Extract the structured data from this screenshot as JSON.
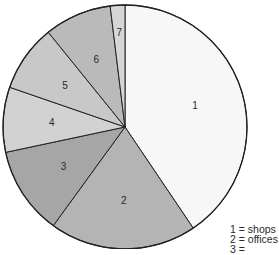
{
  "chart_data": {
    "type": "pie",
    "title": "",
    "start_angle_deg": 0,
    "direction": "clockwise",
    "center": [
      125,
      127
    ],
    "radius": 122,
    "slices": [
      {
        "label": "1",
        "category": "shops",
        "angle_deg": 146,
        "share_pct": 40.6,
        "color": "#f7f7f7"
      },
      {
        "label": "2",
        "category": "offices",
        "angle_deg": 70,
        "share_pct": 19.4,
        "color": "#b4b4b4"
      },
      {
        "label": "3",
        "category": "",
        "angle_deg": 42,
        "share_pct": 11.7,
        "color": "#a6a6a6"
      },
      {
        "label": "4",
        "category": "",
        "angle_deg": 31,
        "share_pct": 8.6,
        "color": "#d2d2d2"
      },
      {
        "label": "5",
        "category": "",
        "angle_deg": 32,
        "share_pct": 8.9,
        "color": "#c8c8c8"
      },
      {
        "label": "6",
        "category": "",
        "angle_deg": 32,
        "share_pct": 8.9,
        "color": "#bababa"
      },
      {
        "label": "7",
        "category": "",
        "angle_deg": 7,
        "share_pct": 1.9,
        "color": "#d6d6d6"
      }
    ],
    "legend": {
      "position": "bottom-right (partially cut off)",
      "entries": [
        "1 = shops",
        "2 = offices",
        "3 = ..."
      ]
    },
    "stroke_color": "#222222"
  },
  "legend": {
    "items": [
      {
        "text": "1 = shops"
      },
      {
        "text": "2 = offices"
      },
      {
        "text": "3 = "
      }
    ]
  }
}
